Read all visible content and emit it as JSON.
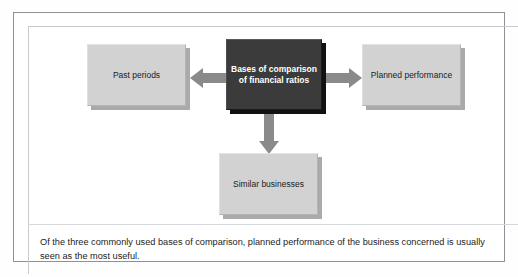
{
  "figure": {
    "center_node": {
      "id": "bases-of-comparison",
      "label": "Bases of comparison of financial ratios",
      "style": "dark",
      "text_color": "#ffffff",
      "fill_color": "#3b3b3b"
    },
    "nodes": [
      {
        "id": "past-periods",
        "label": "Past periods",
        "style": "light",
        "fill_color": "#d2d2d2",
        "text_color": "#1b1b1b",
        "position": "left"
      },
      {
        "id": "planned-performance",
        "label": "Planned performance",
        "style": "light",
        "fill_color": "#d2d2d2",
        "text_color": "#1b1b1b",
        "position": "right"
      },
      {
        "id": "similar-businesses",
        "label": "Similar businesses",
        "style": "light",
        "fill_color": "#d2d2d2",
        "text_color": "#1b1b1b",
        "position": "bottom"
      }
    ],
    "arrows": [
      {
        "id": "arrow-to-past-periods",
        "icon": "arrow-left-icon",
        "direction": "left",
        "color": "#8a8a8a"
      },
      {
        "id": "arrow-to-planned-performance",
        "icon": "arrow-right-icon",
        "direction": "right",
        "color": "#8a8a8a"
      },
      {
        "id": "arrow-to-similar-businesses",
        "icon": "arrow-down-icon",
        "direction": "down",
        "color": "#8a8a8a"
      }
    ],
    "caption": "Of the three commonly used bases of comparison, planned performance of the business concerned is usually seen as the most useful.",
    "frame_border_color": "#8e9196",
    "background_color": "#ffffff"
  }
}
